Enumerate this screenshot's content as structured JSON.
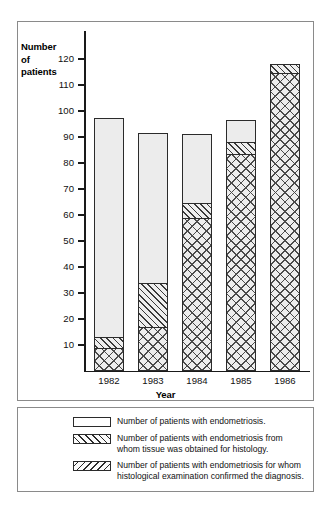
{
  "chart_data": {
    "type": "bar",
    "stacked": true,
    "title": "",
    "xlabel": "Year",
    "ylabel": "Number of patients",
    "ylabel_lines": [
      "Number",
      "of",
      "patients"
    ],
    "categories": [
      "1982",
      "1983",
      "1984",
      "1985",
      "1986"
    ],
    "ylim": [
      0,
      120
    ],
    "yticks": [
      10,
      20,
      30,
      40,
      50,
      60,
      70,
      80,
      90,
      100,
      110,
      120
    ],
    "grid": false,
    "legend_position": "below-plot",
    "series": [
      {
        "name": "Number of patients with endometriosis.",
        "pattern": "plain",
        "cumulative_top": [
          97.5,
          91.5,
          91,
          96.5,
          118
        ]
      },
      {
        "name": "Number of patients with endometriosis from whom tissue was obtained for histology.",
        "pattern": "forward-diagonal",
        "cumulative_top": [
          13,
          34,
          64.5,
          88,
          118
        ]
      },
      {
        "name": "Number of patients with endometriosis for whom histological examination confirmed the diagnosis.",
        "pattern": "crosshatch",
        "cumulative_top": [
          9,
          17,
          59,
          83.5,
          114.5
        ]
      }
    ],
    "values_by_year": {
      "1982": {
        "endometriosis_total": 97.5,
        "tissue_for_histology": 13,
        "histology_confirmed": 9
      },
      "1983": {
        "endometriosis_total": 91.5,
        "tissue_for_histology": 34,
        "histology_confirmed": 17
      },
      "1984": {
        "endometriosis_total": 91,
        "tissue_for_histology": 64.5,
        "histology_confirmed": 59
      },
      "1985": {
        "endometriosis_total": 96.5,
        "tissue_for_histology": 88,
        "histology_confirmed": 83.5
      },
      "1986": {
        "endometriosis_total": 118,
        "tissue_for_histology": 118,
        "histology_confirmed": 114.5
      }
    }
  },
  "axes": {
    "y_title_lines": [
      "Number",
      "of",
      "patients"
    ],
    "x_title": "Year",
    "y_tick_labels": [
      "120",
      "110",
      "100",
      "90",
      "80",
      "70",
      "60",
      "50",
      "40",
      "30",
      "20",
      "10"
    ],
    "x_tick_labels": [
      "1982",
      "1983",
      "1984",
      "1985",
      "1986"
    ]
  },
  "legend": {
    "entries": [
      {
        "swatch": "plain-box",
        "lines": [
          "Number of patients with endometriosis."
        ]
      },
      {
        "swatch": "forward-hatch-box",
        "lines": [
          "Number of patients with endometriosis from",
          "whom tissue was obtained for histology."
        ]
      },
      {
        "swatch": "backward-hatch-box",
        "lines": [
          "Number of patients with endometriosis for whom",
          "histological examination confirmed the diagnosis."
        ]
      }
    ]
  },
  "colors": {
    "axis": "#1a1a1a",
    "bar_outline": "#2b2b2b",
    "plain_fill": "#ececec",
    "hatch_stroke": "#4a4a4a",
    "panel_border": "#8a8a8a",
    "background": "#ffffff"
  }
}
